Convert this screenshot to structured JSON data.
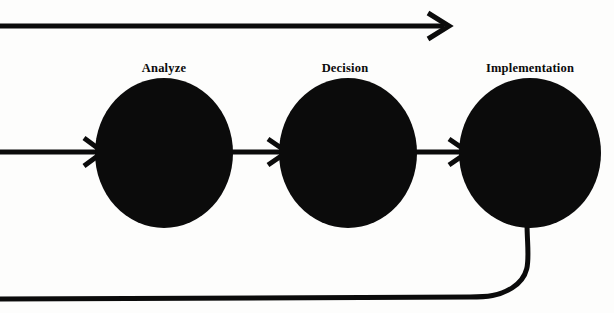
{
  "diagram": {
    "type": "process-flow",
    "title": "",
    "background_color": "#fdfdfc",
    "ink_color": "#0b0b0b",
    "nodes": [
      {
        "id": "analyze",
        "label": "Analyze",
        "shape": "filled-circle",
        "fill": "#0b0b0b",
        "cx": 164,
        "cy": 153,
        "rx": 69,
        "ry": 75,
        "label_x": 164,
        "label_y": 72
      },
      {
        "id": "decision",
        "label": "Decision",
        "shape": "filled-circle",
        "fill": "#0b0b0b",
        "cx": 348,
        "cy": 153,
        "rx": 69,
        "ry": 75,
        "label_x": 345,
        "label_y": 72
      },
      {
        "id": "implementation",
        "label": "Implementation",
        "shape": "filled-circle",
        "fill": "#0b0b0b",
        "cx": 530,
        "cy": 153,
        "rx": 71,
        "ry": 75,
        "label_x": 530,
        "label_y": 72
      }
    ],
    "connectors": [
      {
        "id": "top-feedforward-arrow",
        "kind": "straight-arrow",
        "from_x": 0,
        "from_y": 26,
        "to_x": 448,
        "to_y": 26,
        "has_arrowhead": true,
        "stroke_width": 5
      },
      {
        "id": "input-arrow-to-analyze",
        "kind": "straight-arrow",
        "from_x": 0,
        "from_y": 152,
        "to_x": 101,
        "to_y": 152,
        "has_arrowhead": true,
        "stroke_width": 5
      },
      {
        "id": "analyze-to-decision-arrow",
        "kind": "straight-arrow",
        "from_x": 232,
        "from_y": 152,
        "to_x": 285,
        "to_y": 152,
        "has_arrowhead": true,
        "stroke_width": 5
      },
      {
        "id": "decision-to-implementation-arrow",
        "kind": "straight-arrow",
        "from_x": 415,
        "from_y": 152,
        "to_x": 466,
        "to_y": 152,
        "has_arrowhead": true,
        "stroke_width": 5
      },
      {
        "id": "feedback-loop-line",
        "kind": "curved-line",
        "from_x": 527,
        "from_y": 226,
        "to_x": 0,
        "to_y": 298,
        "has_arrowhead": false,
        "stroke_width": 5
      }
    ]
  }
}
